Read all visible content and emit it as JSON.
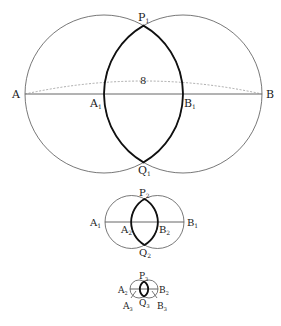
{
  "figure": {
    "stage1": {
      "points": {
        "A": "A",
        "B": "B",
        "A1": "A",
        "B1": "B",
        "P1": "P",
        "Q1": "Q"
      },
      "subscripts": {
        "A1": "1",
        "B1": "1",
        "P1": "1",
        "Q1": "1"
      },
      "arc_label": "8"
    },
    "stage2": {
      "points": {
        "A1": "A",
        "B1": "B",
        "A2": "A",
        "B2": "B",
        "P2": "P",
        "Q2": "Q"
      },
      "subscripts": {
        "A1": "1",
        "B1": "1",
        "A2": "2",
        "B2": "2",
        "P2": "2",
        "Q2": "2"
      }
    },
    "stage3": {
      "points": {
        "A2": "A",
        "B2": "B",
        "A3": "A",
        "B3": "B",
        "P3": "P",
        "Q3": "Q"
      },
      "subscripts": {
        "A2": "2",
        "B2": "2",
        "A3": "3",
        "B3": "3",
        "P3": "3",
        "Q3": "3"
      }
    }
  }
}
